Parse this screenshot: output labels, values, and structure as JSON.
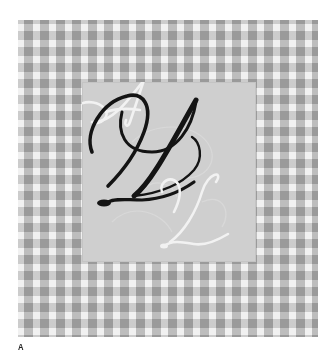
{
  "figure": {
    "monogram": {
      "letters": [
        "A",
        "D",
        "L"
      ],
      "primary_letter": "D",
      "secondary_letters": [
        "A",
        "L"
      ]
    },
    "caption_label": "A",
    "colors": {
      "background": "#ffffff",
      "pattern_base": "#c9c9c9",
      "inner_square": "#cfcfcf",
      "primary_letter": "#1a1a1a",
      "secondary_letters": "#f0f0f0"
    }
  }
}
